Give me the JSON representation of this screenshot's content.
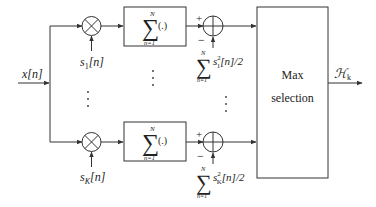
{
  "diagram": {
    "input_label": "x[n]",
    "branches": [
      {
        "id": "1",
        "signal_label_base": "s",
        "signal_label_sub": "1",
        "signal_label_arg": "[n]",
        "sum_upper": "N",
        "sum_lower": "n=1",
        "sum_operand": "(.)",
        "energy_sum_upper": "N",
        "energy_sum_lower": "n=1",
        "energy_base": "s",
        "energy_sub": "1",
        "energy_sup": "2",
        "energy_tail": "[n]/2",
        "plus_sign": "+",
        "minus_sign": "−"
      },
      {
        "id": "K",
        "signal_label_base": "s",
        "signal_label_sub": "K",
        "signal_label_arg": "[n]",
        "sum_upper": "N",
        "sum_lower": "n=1",
        "sum_operand": "(.)",
        "energy_sum_upper": "N",
        "energy_sum_lower": "n=1",
        "energy_base": "s",
        "energy_sub": "K",
        "energy_sup": "2",
        "energy_tail": "[n]/2",
        "plus_sign": "+",
        "minus_sign": "−"
      }
    ],
    "sum_symbol": "∑",
    "max_block": {
      "line1": "Max",
      "line2": "selection"
    },
    "output_label_main": "ℋ",
    "output_label_sub": "k",
    "colors": {
      "stroke": "#333333",
      "text": "#222222",
      "background": "#ffffff"
    }
  }
}
